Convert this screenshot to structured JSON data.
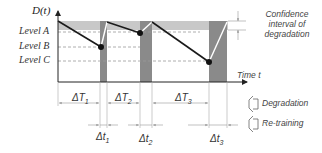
{
  "diagram": {
    "y_axis_label": "D(t)",
    "x_axis_label": "Time t",
    "levels": [
      {
        "label": "Level A"
      },
      {
        "label": "Level B"
      },
      {
        "label": "Level C"
      }
    ],
    "confidence_label_lines": [
      "Confidence",
      "interval of",
      "degradation"
    ],
    "intervals": {
      "big": [
        {
          "label": "ΔT",
          "sub": "1"
        },
        {
          "label": "ΔT",
          "sub": "2"
        },
        {
          "label": "ΔT",
          "sub": "3"
        }
      ],
      "small": [
        {
          "label": "Δt",
          "sub": "1"
        },
        {
          "label": "Δt",
          "sub": "2"
        },
        {
          "label": "Δt",
          "sub": "3"
        }
      ]
    },
    "legend": [
      {
        "label": "Degradation",
        "icon": "degradation-bracket-icon"
      },
      {
        "label": "Re-training",
        "icon": "retraining-bracket-icon"
      }
    ],
    "colors": {
      "band": "#c8c8c8",
      "bar": "#8a8a8a",
      "line": "#1a1a1a",
      "dash": "#9a9a9a",
      "axis": "#222222"
    }
  }
}
